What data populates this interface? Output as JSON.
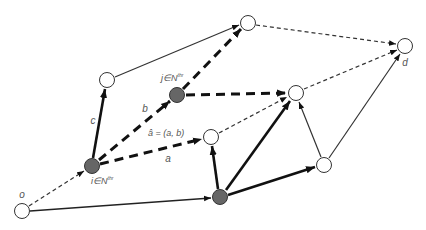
{
  "diagram": {
    "title": "",
    "colors": {
      "edge": "#111111",
      "thin_edge": "#333333",
      "node_fill_open": "#ffffff",
      "node_fill_solid": "#666666",
      "node_stroke": "#333333",
      "label": "#555555"
    },
    "nodes": [
      {
        "id": "o",
        "x": 22,
        "y": 211,
        "type": "open",
        "label": "o"
      },
      {
        "id": "i",
        "x": 92,
        "y": 166,
        "type": "solid",
        "label": "i∈N"
      },
      {
        "id": "n_c",
        "x": 107,
        "y": 80,
        "type": "open",
        "label": ""
      },
      {
        "id": "j",
        "x": 177,
        "y": 95,
        "type": "solid",
        "label": "j∈N"
      },
      {
        "id": "n_top",
        "x": 248,
        "y": 23,
        "type": "open",
        "label": ""
      },
      {
        "id": "d",
        "x": 405,
        "y": 46,
        "type": "open",
        "label": "d"
      },
      {
        "id": "n_mid",
        "x": 296,
        "y": 93,
        "type": "open",
        "label": ""
      },
      {
        "id": "n_a",
        "x": 211,
        "y": 137,
        "type": "open",
        "label": ""
      },
      {
        "id": "n_bot",
        "x": 220,
        "y": 197,
        "type": "solid",
        "label": ""
      },
      {
        "id": "n_br",
        "x": 324,
        "y": 165,
        "type": "open",
        "label": ""
      }
    ],
    "labels": {
      "o": "o",
      "i": "i∈N",
      "i_sup": "thr",
      "j": "j∈N",
      "j_sup": "thr",
      "d": "d",
      "a": "a",
      "b": "b",
      "c": "c",
      "a_hat": "â = (a, b)"
    },
    "edges": [
      {
        "from": "o",
        "to": "i",
        "style": "thin-dashed"
      },
      {
        "from": "o",
        "to": "n_bot",
        "style": "thin-solid"
      },
      {
        "from": "i",
        "to": "n_c",
        "style": "thick-solid",
        "label": "c"
      },
      {
        "from": "i",
        "to": "j",
        "style": "thick-dashed",
        "label": "b"
      },
      {
        "from": "i",
        "to": "n_a",
        "style": "thick-dashed",
        "label": "a"
      },
      {
        "from": "j",
        "to": "n_top",
        "style": "thick-dashed"
      },
      {
        "from": "j",
        "to": "n_mid",
        "style": "thick-dashed"
      },
      {
        "from": "n_c",
        "to": "n_top",
        "style": "thin-solid"
      },
      {
        "from": "n_top",
        "to": "d",
        "style": "thin-dashed"
      },
      {
        "from": "n_mid",
        "to": "d",
        "style": "thin-dashed"
      },
      {
        "from": "n_a",
        "to": "n_mid",
        "style": "thin-dashed"
      },
      {
        "from": "n_bot",
        "to": "n_a",
        "style": "thick-solid"
      },
      {
        "from": "n_bot",
        "to": "n_mid",
        "style": "thick-solid"
      },
      {
        "from": "n_bot",
        "to": "n_br",
        "style": "thick-solid"
      },
      {
        "from": "n_br",
        "to": "n_mid",
        "style": "thin-solid"
      },
      {
        "from": "n_br",
        "to": "d",
        "style": "thin-solid"
      }
    ]
  }
}
